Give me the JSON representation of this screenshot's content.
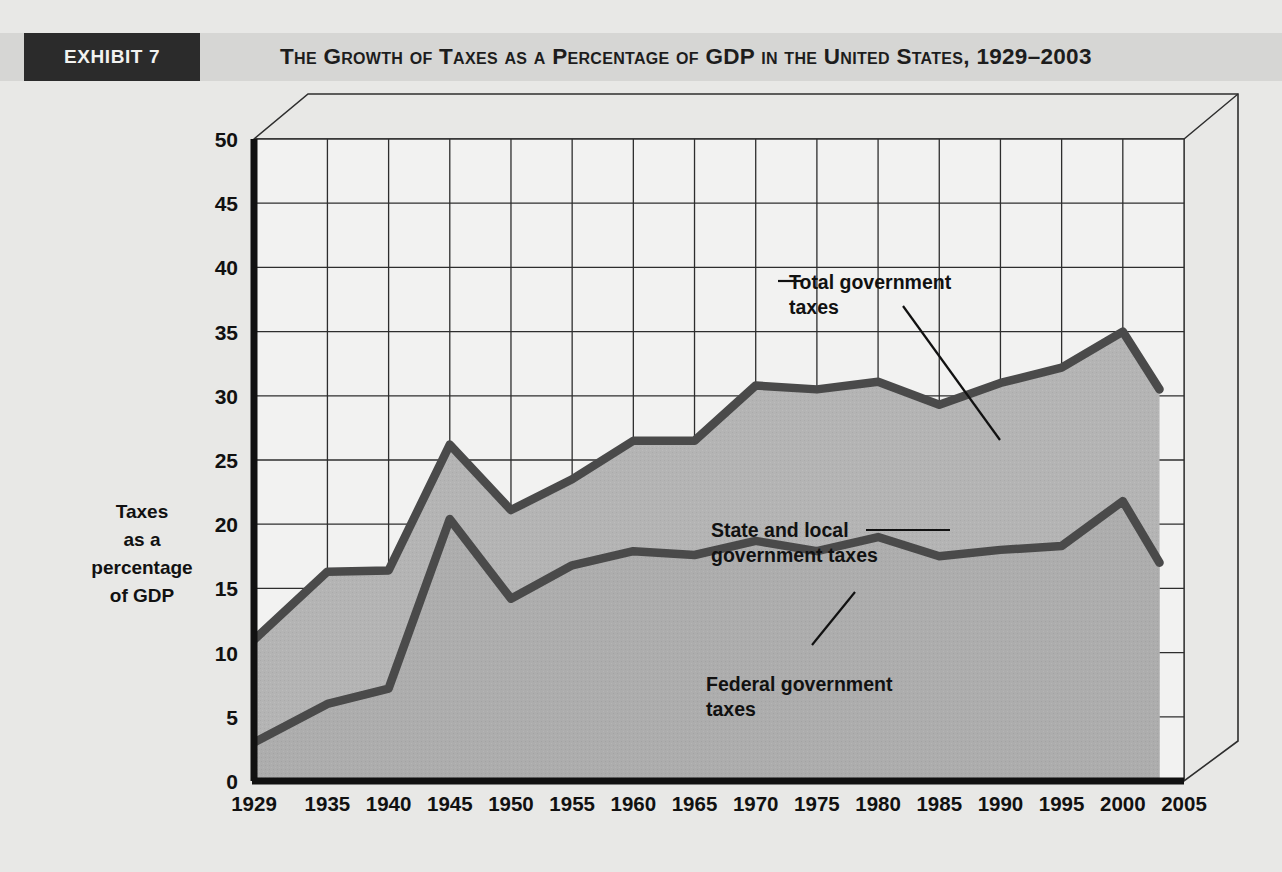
{
  "header": {
    "exhibit_label": "EXHIBIT 7",
    "title": "The Growth of Taxes as a Percentage of GDP in the United States, 1929–2003",
    "exhibit_box_color": "#2b2b2b",
    "band_color": "#d6d6d4"
  },
  "axis_labels": {
    "y_line1": "Taxes",
    "y_line2": "as a",
    "y_line3": "percentage",
    "y_line4": "of GDP",
    "x": "Year"
  },
  "annotations": {
    "total_line1": "Total government",
    "total_line2": "taxes",
    "state_line1": "State and local",
    "state_line2": "government taxes",
    "federal_line1": "Federal government",
    "federal_line2": "taxes"
  },
  "chart_data": {
    "type": "area",
    "title": "The Growth of Taxes as a Percentage of GDP in the United States, 1929–2003",
    "xlabel": "Year",
    "ylabel": "Taxes as a percentage of GDP",
    "xlim": [
      1929,
      2005
    ],
    "ylim": [
      0,
      50
    ],
    "ytick_step": 5,
    "yticks": [
      0,
      5,
      10,
      15,
      20,
      25,
      30,
      35,
      40,
      45,
      50
    ],
    "xticks": [
      1929,
      1935,
      1940,
      1945,
      1950,
      1955,
      1960,
      1965,
      1970,
      1975,
      1980,
      1985,
      1990,
      1995,
      2000,
      2005
    ],
    "x": [
      1929,
      1935,
      1940,
      1945,
      1950,
      1955,
      1960,
      1965,
      1970,
      1975,
      1980,
      1985,
      1990,
      1995,
      2000,
      2003
    ],
    "grid": true,
    "legend": "annotations-inline",
    "series": [
      {
        "name": "Total government taxes",
        "values": [
          11.0,
          16.3,
          16.4,
          26.2,
          21.1,
          23.5,
          26.5,
          26.5,
          30.8,
          30.5,
          31.1,
          29.3,
          31.0,
          32.2,
          35.0,
          30.5
        ],
        "line_color": "#4a4a4a",
        "fill_color": "#b4b4b4"
      },
      {
        "name": "Federal government taxes",
        "values": [
          3.0,
          6.0,
          7.2,
          20.4,
          14.2,
          16.8,
          17.9,
          17.6,
          18.7,
          17.9,
          19.0,
          17.5,
          18.0,
          18.3,
          21.8,
          17.0
        ],
        "line_color": "#4a4a4a",
        "fill_color": "#adadad"
      }
    ]
  }
}
